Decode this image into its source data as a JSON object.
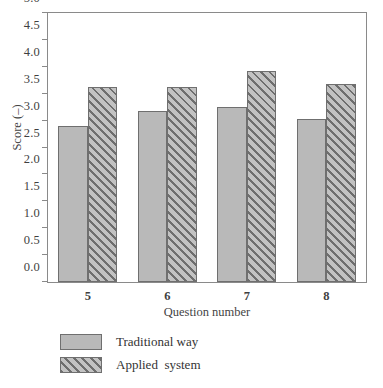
{
  "chart_data": {
    "type": "bar",
    "title": "",
    "subtitle": "",
    "xlabel": "Question number",
    "ylabel": "Score (–)",
    "categories": [
      "5",
      "6",
      "7",
      "8"
    ],
    "series": [
      {
        "name": "Traditional way",
        "values": [
          2.9,
          3.17,
          3.26,
          3.03
        ],
        "fill": "#b9b9b9",
        "pattern": "solid"
      },
      {
        "name": "Applied  system",
        "values": [
          3.63,
          3.62,
          3.92,
          3.68
        ],
        "fill": "#a8a8a8",
        "pattern": "diagonal-hatch"
      }
    ],
    "ylim": [
      0.0,
      5.0
    ],
    "ytick_labels": [
      "0.0",
      "0.5",
      "1.0",
      "1.5",
      "2.0",
      "2.5",
      "3.0",
      "3.5",
      "4.0",
      "4.5",
      "5.0"
    ],
    "ytick_values": [
      0.0,
      0.5,
      1.0,
      1.5,
      2.0,
      2.5,
      3.0,
      3.5,
      4.0,
      4.5,
      5.0
    ],
    "grid": false,
    "frame": true,
    "tick_direction": "out",
    "legend_position": "below-left",
    "legend_entries": [
      "Traditional way",
      "Applied  system"
    ],
    "axis_color": "#8a8a8a",
    "bar_edge_color": "#6f6f6f"
  }
}
